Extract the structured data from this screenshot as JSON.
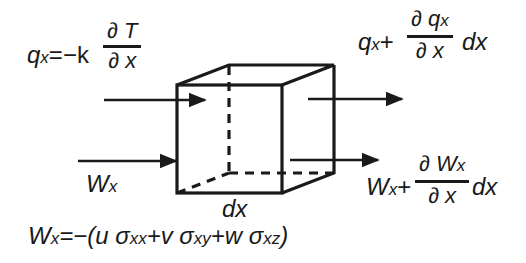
{
  "diagram": {
    "type": "control-volume energy balance (x-direction)",
    "colors": {
      "ink": "#1a1a1a",
      "background": "#ffffff"
    },
    "element": {
      "shape": "cube",
      "dimension_label": "dx"
    },
    "heat_flux_in": {
      "lhs": "q",
      "lhs_sub": "x",
      "equals": "=−k",
      "frac_num": "∂ T",
      "frac_den": "∂ x"
    },
    "heat_flux_out": {
      "lhs": "q",
      "lhs_sub": "x",
      "plus": "+",
      "frac_num": "∂ q",
      "frac_num_sub": "x",
      "frac_den": "∂ x",
      "suffix": "dx"
    },
    "work_in": {
      "label": "W",
      "label_sub": "x"
    },
    "work_out": {
      "lhs": "W",
      "lhs_sub": "x",
      "plus": "+",
      "frac_num": "∂ W",
      "frac_num_sub": "x",
      "frac_den": "∂ x",
      "suffix": "dx"
    },
    "work_definition": {
      "lhs": "W",
      "lhs_sub": "x",
      "rhs": "=−(u σ",
      "t1_sub": "xx",
      "t2": "+v σ",
      "t2_sub": "xy",
      "t3": "+w σ",
      "t3_sub": "xz",
      "close": ")"
    }
  }
}
